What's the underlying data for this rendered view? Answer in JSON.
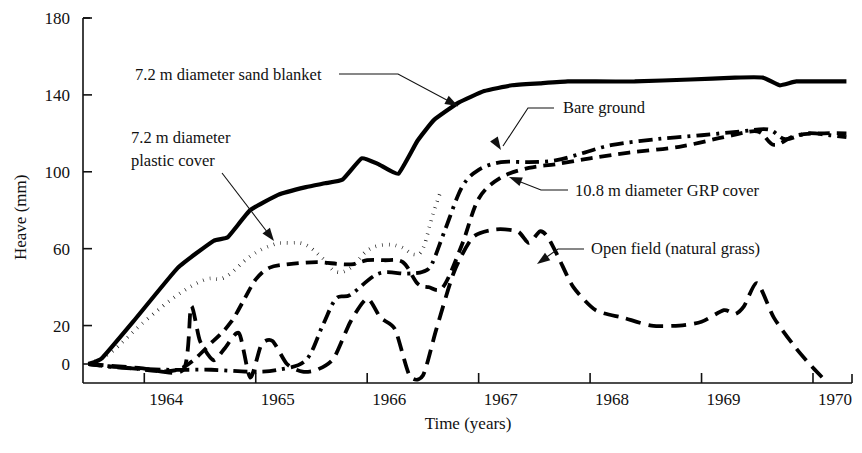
{
  "chart_data": {
    "type": "line",
    "title": "",
    "xlabel": "Time (years)",
    "ylabel": "Heave (mm)",
    "xlim": [
      1963.45,
      1970.35
    ],
    "ylim": [
      -10,
      180
    ],
    "grid": false,
    "legend_position": "inline-annotations",
    "xticks": [
      1964,
      1965,
      1966,
      1967,
      1968,
      1969,
      1970
    ],
    "xtick_labels": [
      "1964",
      "1965",
      "1966",
      "1967",
      "1968",
      "1969",
      "1970"
    ],
    "yticks": [
      0,
      20,
      60,
      100,
      140,
      180
    ],
    "ytick_labels": [
      "0",
      "20",
      "60",
      "100",
      "140",
      "180"
    ],
    "series": [
      {
        "name": "7.2 m diameter sand blanket",
        "style": "solid",
        "x": [
          1963.5,
          1963.62,
          1963.9,
          1964.3,
          1964.62,
          1964.75,
          1964.95,
          1965.2,
          1965.45,
          1965.62,
          1965.78,
          1965.95,
          1966.1,
          1966.28,
          1966.45,
          1966.6,
          1966.82,
          1967.05,
          1967.3,
          1967.55,
          1967.8,
          1968.05,
          1968.4,
          1968.9,
          1969.3,
          1969.55,
          1969.7,
          1969.85,
          1970.1,
          1970.3
        ],
        "y": [
          0,
          3,
          22,
          50,
          64,
          66,
          80,
          88,
          92,
          94,
          96,
          107,
          104,
          99,
          116,
          127,
          136,
          142,
          145,
          146,
          147,
          147,
          147,
          148,
          149,
          149,
          145,
          147,
          147,
          147
        ]
      },
      {
        "name": "7.2 m diameter plastic cover",
        "style": "dotted",
        "x": [
          1963.5,
          1963.7,
          1964.0,
          1964.3,
          1964.55,
          1964.72,
          1964.95,
          1965.15,
          1965.3,
          1965.45,
          1965.6,
          1965.72,
          1965.85,
          1966.0,
          1966.15,
          1966.3,
          1966.42,
          1966.5,
          1966.58,
          1966.66
        ],
        "y": [
          0,
          6,
          22,
          36,
          44,
          45,
          56,
          62,
          63,
          62,
          55,
          48,
          50,
          59,
          62,
          61,
          57,
          60,
          76,
          90
        ]
      },
      {
        "name": "Bare ground",
        "style": "dashdot",
        "x": [
          1963.5,
          1963.8,
          1964.2,
          1964.6,
          1964.95,
          1965.2,
          1965.45,
          1965.6,
          1965.72,
          1965.85,
          1966.1,
          1966.35,
          1966.5,
          1966.58,
          1966.7,
          1966.85,
          1967.0,
          1967.2,
          1967.45,
          1967.7,
          1967.95,
          1968.2,
          1968.6,
          1969.0,
          1969.35,
          1969.6,
          1969.75,
          1969.95,
          1970.15,
          1970.3
        ],
        "y": [
          0,
          -2,
          -3,
          -3,
          -4,
          -3,
          2,
          20,
          34,
          36,
          47,
          47,
          48,
          52,
          70,
          92,
          101,
          105,
          105,
          106,
          110,
          114,
          117,
          119,
          121,
          122,
          117,
          120,
          119,
          118
        ]
      },
      {
        "name": "10.8 m diameter GRP cover",
        "style": "dashed",
        "x": [
          1963.5,
          1963.85,
          1964.3,
          1964.62,
          1964.78,
          1964.9,
          1965.0,
          1965.12,
          1965.3,
          1965.55,
          1965.75,
          1965.88,
          1966.0,
          1966.15,
          1966.32,
          1966.45,
          1966.55,
          1966.68,
          1966.85,
          1967.0,
          1967.2,
          1967.45,
          1967.7,
          1968.0,
          1968.35,
          1968.8,
          1969.2,
          1969.5,
          1969.65,
          1969.85,
          1970.1,
          1970.3
        ],
        "y": [
          0,
          -2,
          -3,
          12,
          22,
          34,
          44,
          50,
          52,
          53,
          52,
          52,
          54,
          54,
          53,
          42,
          40,
          40,
          62,
          86,
          97,
          102,
          104,
          107,
          110,
          113,
          118,
          121,
          114,
          119,
          120,
          120
        ]
      },
      {
        "name": "Open field (natural grass)",
        "style": "longdash",
        "x": [
          1963.5,
          1963.95,
          1964.35,
          1964.42,
          1964.5,
          1964.62,
          1964.72,
          1964.85,
          1964.95,
          1965.05,
          1965.15,
          1965.28,
          1965.42,
          1965.55,
          1965.7,
          1965.85,
          1966.0,
          1966.12,
          1966.25,
          1966.38,
          1966.5,
          1966.62,
          1966.78,
          1966.95,
          1967.15,
          1967.35,
          1967.45,
          1967.55,
          1967.62,
          1967.72,
          1967.85,
          1968.05,
          1968.3,
          1968.55,
          1968.8,
          1969.0,
          1969.2,
          1969.3,
          1969.38,
          1969.5,
          1969.65,
          1969.85,
          1970.0,
          1970.1
        ],
        "y": [
          0,
          -2,
          -3,
          30,
          12,
          2,
          8,
          16,
          -7,
          10,
          12,
          0,
          -4,
          -3,
          3,
          22,
          34,
          24,
          18,
          -6,
          -6,
          18,
          48,
          66,
          70,
          69,
          63,
          69,
          66,
          55,
          40,
          28,
          24,
          20,
          20,
          22,
          28,
          26,
          30,
          42,
          24,
          8,
          -2,
          -8
        ]
      }
    ],
    "annotations": [
      {
        "id": "sand-blanket",
        "text": "7.2 m diameter sand blanket",
        "text_x": 135,
        "text_y": 80,
        "leader": "M 339,74 L 398,74 L 458,106",
        "arrow_x": 458,
        "arrow_y": 106,
        "arrow_angle": 28
      },
      {
        "id": "plastic-cover",
        "text_line1": "7.2 m diameter",
        "text_line2": "plastic cover",
        "text_x": 131,
        "text_y": 143,
        "text_y2": 166,
        "leader": "M 222,173 L 271,237",
        "arrow_x": 274,
        "arrow_y": 241,
        "arrow_angle": 53
      },
      {
        "id": "bare-ground",
        "text": "Bare ground",
        "text_x": 563,
        "text_y": 113,
        "leader": "M 554,108 L 528,108 L 503,146",
        "arrow_x": 501,
        "arrow_y": 150,
        "arrow_angle": 57
      },
      {
        "id": "grp-cover",
        "text": "10.8 m diameter GRP cover",
        "text_x": 575,
        "text_y": 196,
        "leader": "M 568,190 L 541,190 L 513,179",
        "arrow_x": 509,
        "arrow_y": 177,
        "arrow_angle": 201
      },
      {
        "id": "open-field",
        "text": "Open field (natural grass)",
        "text_x": 591,
        "text_y": 254,
        "leader": "M 584,249 L 558,249 L 541,261",
        "arrow_x": 537,
        "arrow_y": 264,
        "arrow_angle": 145
      }
    ]
  },
  "colors": {
    "ink": "#111111",
    "background": "#ffffff"
  }
}
